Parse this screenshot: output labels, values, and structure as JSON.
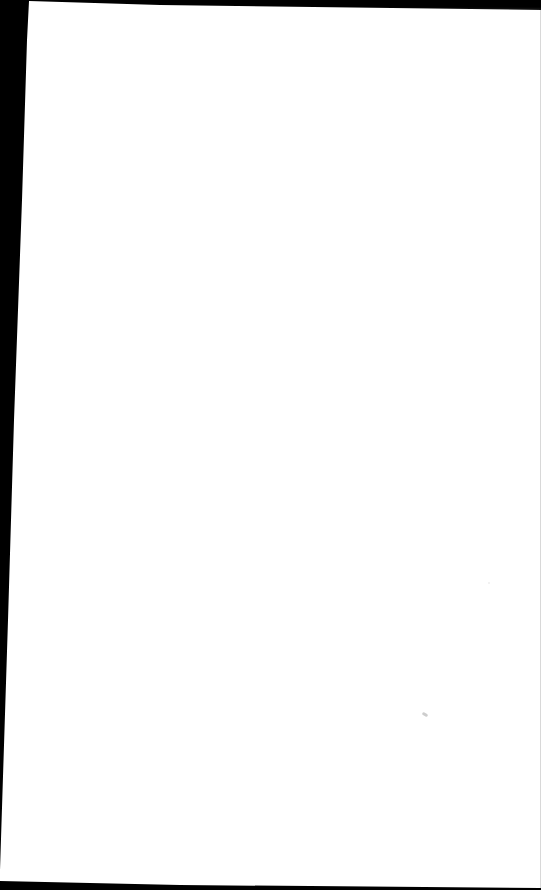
{
  "document": {
    "type": "scanned-page",
    "content": "",
    "page_color": "#ffffff",
    "border_color": "#000000",
    "notes": []
  }
}
